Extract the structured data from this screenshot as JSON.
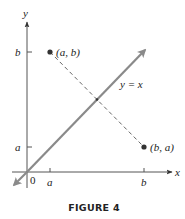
{
  "figure": {
    "caption": "FIGURE 4",
    "axes": {
      "x_label": "x",
      "y_label": "y",
      "origin_label": "0",
      "x_ticks": [
        "a",
        "b"
      ],
      "y_ticks": [
        "b",
        "a"
      ]
    },
    "line": {
      "label": "y = x",
      "color": "#8a8a8a"
    },
    "points": [
      {
        "label": "(a, b)"
      },
      {
        "label": "(b, a)"
      }
    ],
    "dashed_segment_color": "#555555",
    "axis_color": "#555555",
    "point_color": "#333333"
  }
}
